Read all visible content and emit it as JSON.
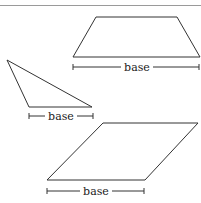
{
  "header": {
    "text": "",
    "note": "cropped heading text at top edge, illegible"
  },
  "figures": [
    {
      "shape": "trapezoid",
      "label": "base",
      "points": [
        [
          96,
          17
        ],
        [
          177,
          17
        ],
        [
          200,
          57
        ],
        [
          73,
          57
        ]
      ],
      "base_line": {
        "x1": 73,
        "x2": 199,
        "y": 67
      },
      "label_x": 137
    },
    {
      "shape": "triangle",
      "label": "base",
      "points": [
        [
          7,
          60
        ],
        [
          92,
          107
        ],
        [
          29,
          107
        ]
      ],
      "base_line": {
        "x1": 29,
        "x2": 93,
        "y": 116
      },
      "label_x": 61
    },
    {
      "shape": "parallelogram",
      "label": "base",
      "points": [
        [
          103,
          123
        ],
        [
          198,
          123
        ],
        [
          145,
          180
        ],
        [
          47,
          180
        ]
      ],
      "base_line": {
        "x1": 47,
        "x2": 144,
        "y": 191
      },
      "label_x": 96
    }
  ],
  "colors": {
    "stroke": "#333333",
    "text": "#222222",
    "rule": "#9a9a9a"
  }
}
